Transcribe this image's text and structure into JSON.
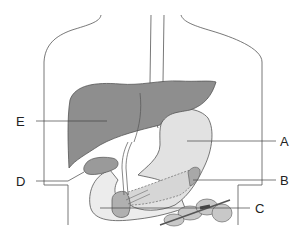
{
  "diagram": {
    "colors": {
      "outline": "#555555",
      "liver": "#8e8e8e",
      "liver_dark": "#7a7a7a",
      "stomach": "#e2e2e2",
      "gallbladder": "#9a9a9a",
      "pancreas": "#a8a8a8",
      "intestine": "#c8c8c8",
      "duodenum": "#ececec"
    },
    "labels": [
      {
        "id": "E",
        "text": "E",
        "organ": "liver",
        "x": 16,
        "y": 115
      },
      {
        "id": "D",
        "text": "D",
        "organ": "gallbladder",
        "x": 16,
        "y": 175
      },
      {
        "id": "A",
        "text": "A",
        "organ": "stomach",
        "x": 280,
        "y": 135
      },
      {
        "id": "B",
        "text": "B",
        "organ": "pancreas",
        "x": 280,
        "y": 175
      },
      {
        "id": "C",
        "text": "C",
        "organ": "duodenum",
        "x": 255,
        "y": 203
      }
    ]
  }
}
